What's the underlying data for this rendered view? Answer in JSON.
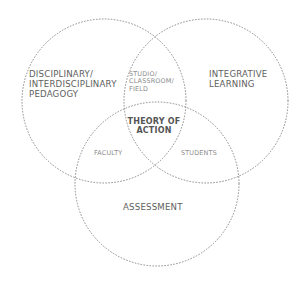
{
  "diagram": {
    "type": "venn",
    "circles": [
      {
        "name": "left",
        "label": "DISCIPLINARY/\nINTERDISCIPLINARY\nPEDAGOGY",
        "cx": 104,
        "cy": 101,
        "r": 82
      },
      {
        "name": "right",
        "label": "INTEGRATIVE\nLEARNING",
        "cx": 206,
        "cy": 101,
        "r": 82
      },
      {
        "name": "bottom",
        "label": "ASSESSMENT",
        "cx": 157,
        "cy": 184,
        "r": 82
      }
    ],
    "overlaps": {
      "left_right": "STUDIO/\nCLASSROOM/\nFIELD",
      "left_bottom": "FACULTY",
      "right_bottom": "STUDENTS",
      "all": "THEORY OF\nACTION"
    },
    "colors": {
      "stroke": "#8c8c8c",
      "text": "#5e5e5e",
      "center_text": "#555555",
      "background": "#ffffff"
    }
  }
}
